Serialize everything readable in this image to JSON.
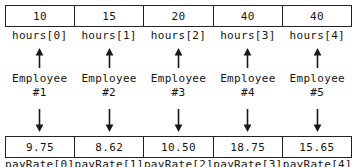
{
  "diagram": {
    "columns": [
      {
        "top_value": "10",
        "top_label": "hours[0]",
        "entity_name": "Employee",
        "entity_number": "#1",
        "bottom_value": "9.75",
        "bottom_label": "payRate[0]"
      },
      {
        "top_value": "15",
        "top_label": "hours[1]",
        "entity_name": "Employee",
        "entity_number": "#2",
        "bottom_value": "8.62",
        "bottom_label": "payRate[1]"
      },
      {
        "top_value": "20",
        "top_label": "hours[2]",
        "entity_name": "Employee",
        "entity_number": "#3",
        "bottom_value": "10.50",
        "bottom_label": "payRate[2]"
      },
      {
        "top_value": "40",
        "top_label": "hours[3]",
        "entity_name": "Employee",
        "entity_number": "#4",
        "bottom_value": "18.75",
        "bottom_label": "payRate[3]"
      },
      {
        "top_value": "40",
        "top_label": "hours[4]",
        "entity_name": "Employee",
        "entity_number": "#5",
        "bottom_value": "15.65",
        "bottom_label": "payRate[4]"
      }
    ],
    "icons": {
      "arrow_up": "arrow-up-icon",
      "arrow_down": "arrow-down-icon"
    },
    "colors": {
      "ink": "#141414",
      "border": "#222222",
      "background": "#ffffff"
    }
  }
}
